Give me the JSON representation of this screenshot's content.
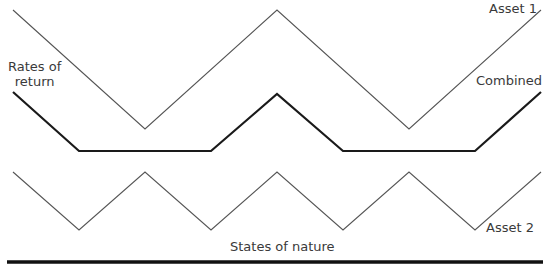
{
  "labels": {
    "y_axis": [
      "Rates of",
      "return"
    ],
    "x_axis": "States of nature",
    "asset1": "Asset 1",
    "combined": "Combined",
    "asset2": "Asset 2"
  },
  "colors": {
    "thin_line": "#555555",
    "thick_line": "#1a1a1a",
    "axis": "#111111"
  },
  "chart_data": {
    "type": "line",
    "title": "",
    "xlabel": "States of nature",
    "ylabel": "Rates of return",
    "grid": false,
    "legend": "inline labels at line ends",
    "series": [
      {
        "name": "Asset 1",
        "points": [
          [
            13,
            10
          ],
          [
            145,
            129
          ],
          [
            277,
            10
          ],
          [
            409,
            129
          ],
          [
            541,
            10
          ]
        ]
      },
      {
        "name": "Combined",
        "points": [
          [
            13,
            92
          ],
          [
            79,
            151
          ],
          [
            211,
            151
          ],
          [
            277,
            94
          ],
          [
            343,
            151
          ],
          [
            475,
            151
          ],
          [
            541,
            92
          ]
        ]
      },
      {
        "name": "Asset 2",
        "points": [
          [
            13,
            172
          ],
          [
            79,
            230
          ],
          [
            145,
            172
          ],
          [
            211,
            230
          ],
          [
            277,
            172
          ],
          [
            343,
            230
          ],
          [
            409,
            172
          ],
          [
            475,
            230
          ],
          [
            541,
            172
          ]
        ]
      }
    ],
    "axis_line": {
      "x1": 7,
      "x2": 543,
      "y": 262
    }
  }
}
